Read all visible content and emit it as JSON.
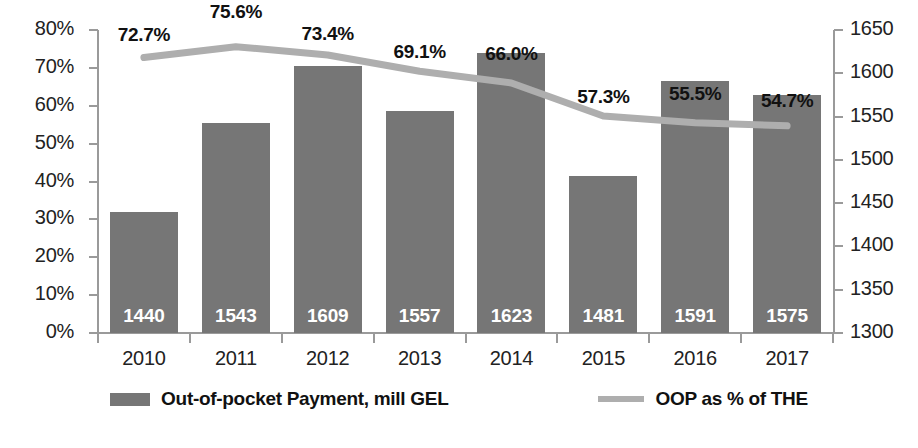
{
  "chart_data": {
    "type": "bar",
    "title": "",
    "subtitle": "",
    "xlabel": "",
    "ylabel": "",
    "grid": false,
    "legend_position": "bottom",
    "categories": [
      "2010",
      "2011",
      "2012",
      "2013",
      "2014",
      "2015",
      "2016",
      "2017"
    ],
    "series": [
      {
        "name": "Out-of-pocket Payment, mill GEL",
        "type": "bar",
        "axis": "right",
        "color": "#767676",
        "values": [
          1440,
          1543,
          1609,
          1557,
          1623,
          1481,
          1591,
          1575
        ],
        "labels": [
          "1440",
          "1543",
          "1609",
          "1557",
          "1623",
          "1481",
          "1591",
          "1575"
        ]
      },
      {
        "name": "OOP as % of THE",
        "type": "line",
        "axis": "left",
        "color": "#aeaeae",
        "values": [
          72.7,
          75.6,
          73.4,
          69.1,
          66.0,
          57.3,
          55.5,
          54.7
        ],
        "labels": [
          "72.7%",
          "75.6%",
          "73.4%",
          "69.1%",
          "66.0%",
          "57.3%",
          "55.5%",
          "54.7%"
        ]
      }
    ],
    "left_axis": {
      "min": 0,
      "max": 80,
      "step": 10,
      "ticks": [
        "0%",
        "10%",
        "20%",
        "30%",
        "40%",
        "50%",
        "60%",
        "70%",
        "80%"
      ]
    },
    "right_axis": {
      "min": 1300,
      "max": 1650,
      "step": 50,
      "ticks": [
        "1300",
        "1350",
        "1400",
        "1450",
        "1500",
        "1550",
        "1600",
        "1650"
      ]
    }
  }
}
